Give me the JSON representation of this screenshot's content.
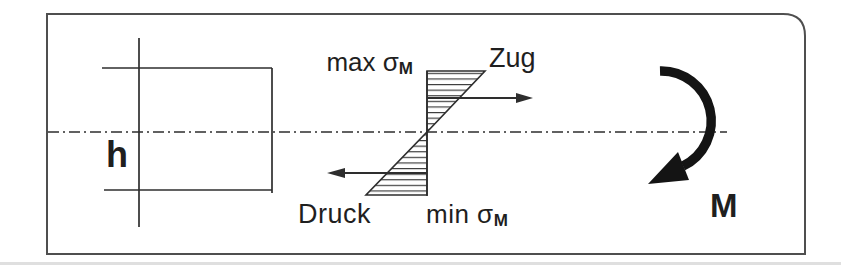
{
  "figure": {
    "labels": {
      "height_dim": "h",
      "max_sigma": {
        "text": "max σ",
        "sub": "M"
      },
      "tension": "Zug",
      "compression": "Druck",
      "min_sigma": {
        "text": "min σ",
        "sub": "M"
      },
      "moment": "M"
    },
    "colors": {
      "line": "#2e2e2e",
      "frame": "#4f4f4f",
      "moment_arrow": "#141414",
      "background": "#ffffff"
    }
  }
}
